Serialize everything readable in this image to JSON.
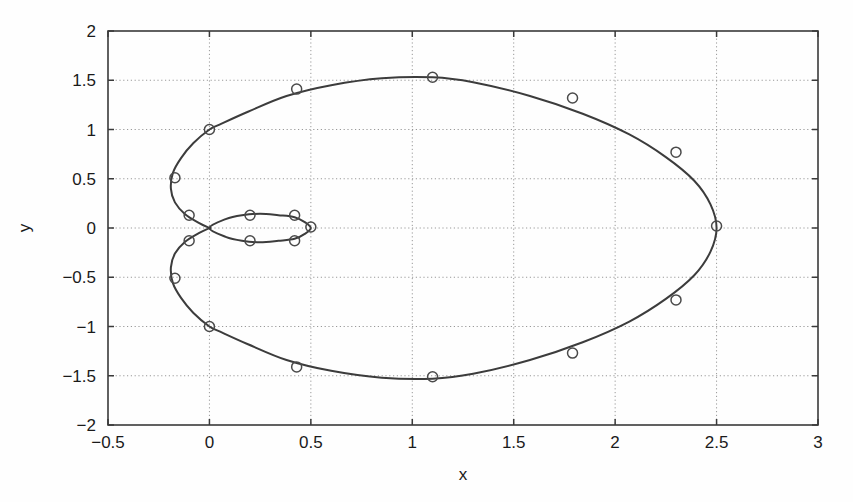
{
  "figure": {
    "background_color": "#fefefe",
    "width": 853,
    "height": 502
  },
  "axes": {
    "left_px": 108,
    "right_px": 818,
    "top_px": 31,
    "bottom_px": 425,
    "box_color": "#3a3a3a",
    "grid_color": "#999999"
  },
  "labels": {
    "xlabel": "x",
    "ylabel": "y"
  },
  "chart_data": {
    "type": "line",
    "title": "",
    "subtitle": "",
    "xlabel": "x",
    "ylabel": "y",
    "xlim": [
      -0.5,
      3
    ],
    "ylim": [
      -2,
      2
    ],
    "xticks": [
      -0.5,
      0,
      0.5,
      1,
      1.5,
      2,
      2.5,
      3
    ],
    "xticklabels": [
      "−0.5",
      "0",
      "0.5",
      "1",
      "1.5",
      "2",
      "2.5",
      "3"
    ],
    "yticks": [
      -2,
      -1.5,
      -1,
      -0.5,
      0,
      0.5,
      1,
      1.5,
      2
    ],
    "yticklabels": [
      "−2",
      "−1.5",
      "−1",
      "−0.5",
      "0",
      "0.5",
      "1",
      "1.5",
      "2"
    ],
    "grid": true,
    "grid_style": "dotted",
    "legend": null,
    "legend_position": "none",
    "annotations": [],
    "line_color": "#3c3c3c",
    "line_width": 2.0,
    "marker": "circle",
    "marker_color": "#4a4a4a",
    "marker_size": 5,
    "series": [
      {
        "name": "outer-loop",
        "closed": true,
        "x": [
          2.5,
          2.47,
          2.39,
          2.25,
          2.07,
          1.84,
          1.58,
          1.3,
          1.1,
          0.85,
          0.6,
          0.38,
          0.19,
          0.05,
          0.0,
          -0.08,
          -0.14,
          -0.18,
          -0.19,
          -0.17,
          -0.12,
          -0.05,
          0.0,
          0.0,
          -0.05,
          -0.12,
          -0.17,
          -0.19,
          -0.18,
          -0.14,
          -0.08,
          0.0,
          0.05,
          0.19,
          0.38,
          0.6,
          0.85,
          1.1,
          1.3,
          1.58,
          1.84,
          2.07,
          2.25,
          2.39,
          2.47,
          2.5
        ],
        "y": [
          0.0,
          0.24,
          0.48,
          0.72,
          0.95,
          1.16,
          1.34,
          1.48,
          1.53,
          1.52,
          1.45,
          1.34,
          1.18,
          1.05,
          1.0,
          0.86,
          0.71,
          0.56,
          0.4,
          0.26,
          0.14,
          0.05,
          0.0,
          0.0,
          -0.05,
          -0.14,
          -0.26,
          -0.4,
          -0.56,
          -0.71,
          -0.86,
          -1.0,
          -1.05,
          -1.18,
          -1.34,
          -1.45,
          -1.52,
          -1.53,
          -1.48,
          -1.34,
          -1.16,
          -0.95,
          -0.72,
          -0.48,
          -0.24,
          0.0
        ]
      },
      {
        "name": "inner-loop",
        "closed": true,
        "x": [
          0.0,
          0.08,
          0.16,
          0.25,
          0.34,
          0.42,
          0.47,
          0.5,
          0.47,
          0.42,
          0.34,
          0.25,
          0.16,
          0.08,
          0.0
        ],
        "y": [
          0.0,
          0.09,
          0.13,
          0.145,
          0.13,
          0.11,
          0.06,
          0.0,
          -0.06,
          -0.11,
          -0.13,
          -0.145,
          -0.13,
          -0.09,
          0.0
        ]
      }
    ],
    "markers": [
      {
        "x": 2.5,
        "y": 0.02
      },
      {
        "x": 2.3,
        "y": 0.77
      },
      {
        "x": 1.79,
        "y": 1.32
      },
      {
        "x": 1.1,
        "y": 1.53
      },
      {
        "x": 0.43,
        "y": 1.41
      },
      {
        "x": 0.0,
        "y": 1.0
      },
      {
        "x": -0.17,
        "y": 0.51
      },
      {
        "x": -0.1,
        "y": 0.13
      },
      {
        "x": -0.1,
        "y": -0.13
      },
      {
        "x": -0.17,
        "y": -0.51
      },
      {
        "x": 0.0,
        "y": -1.0
      },
      {
        "x": 0.43,
        "y": -1.41
      },
      {
        "x": 1.1,
        "y": -1.51
      },
      {
        "x": 1.79,
        "y": -1.27
      },
      {
        "x": 2.3,
        "y": -0.73
      },
      {
        "x": 0.2,
        "y": 0.13
      },
      {
        "x": 0.42,
        "y": 0.13
      },
      {
        "x": 0.5,
        "y": 0.01
      },
      {
        "x": 0.42,
        "y": -0.13
      },
      {
        "x": 0.2,
        "y": -0.13
      }
    ]
  }
}
